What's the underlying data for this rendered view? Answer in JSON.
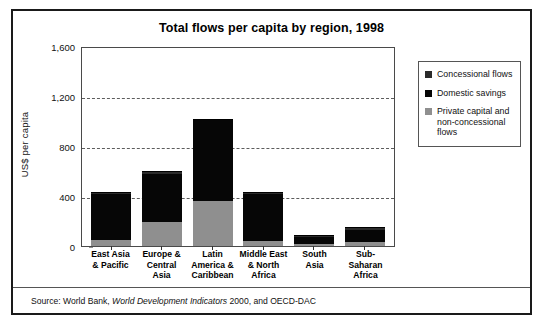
{
  "figure": {
    "title": "Total flows per capita by region, 1998",
    "source_prefix": "Source: World Bank,",
    "source_italic": "World Development Indicators",
    "source_suffix": "2000, and OECD-DAC"
  },
  "legend": {
    "position": "right",
    "items": [
      {
        "label": "Concessional flows",
        "color": "#2b2b2b",
        "icon": "square-swatch"
      },
      {
        "label": "Domestic savings",
        "color": "#060606",
        "icon": "square-swatch"
      },
      {
        "label": "Private capital and non-concessional flows",
        "color": "#8f8f8f",
        "icon": "square-swatch"
      }
    ]
  },
  "chart_data": {
    "type": "bar",
    "subtype": "stacked",
    "title": "Total flows per capita by region, 1998",
    "xlabel": "",
    "ylabel": "US$ per capita",
    "ylim": [
      0,
      1600
    ],
    "yticks": [
      0,
      400,
      800,
      1200,
      1600
    ],
    "ytick_labels": [
      "0",
      "400",
      "800",
      "1,200",
      "1,600"
    ],
    "gridlines": [
      400,
      800,
      1200
    ],
    "grid": true,
    "categories": [
      "East Asia & Pacific",
      "Europe & Central Asia",
      "Latin America & Caribbean",
      "Middle East & North Africa",
      "South Asia",
      "Sub-Saharan Africa"
    ],
    "category_lines": [
      [
        "East Asia",
        "& Pacific"
      ],
      [
        "Europe &",
        "Central",
        "Asia"
      ],
      [
        "Latin",
        "America &",
        "Caribbean"
      ],
      [
        "Middle East",
        "& North",
        "Africa"
      ],
      [
        "South",
        "Asia"
      ],
      [
        "Sub-Saharan",
        "Africa"
      ]
    ],
    "series": [
      {
        "name": "Private capital and non-concessional flows",
        "color": "#8f8f8f",
        "values": [
          50,
          190,
          360,
          40,
          15,
          30
        ]
      },
      {
        "name": "Domestic savings",
        "color": "#060606",
        "values": [
          370,
          390,
          645,
          375,
          55,
          95
        ]
      },
      {
        "name": "Concessional flows",
        "color": "#2b2b2b",
        "values": [
          15,
          20,
          15,
          15,
          15,
          25
        ]
      }
    ],
    "totals": [
      435,
      600,
      1020,
      430,
      85,
      150
    ]
  }
}
